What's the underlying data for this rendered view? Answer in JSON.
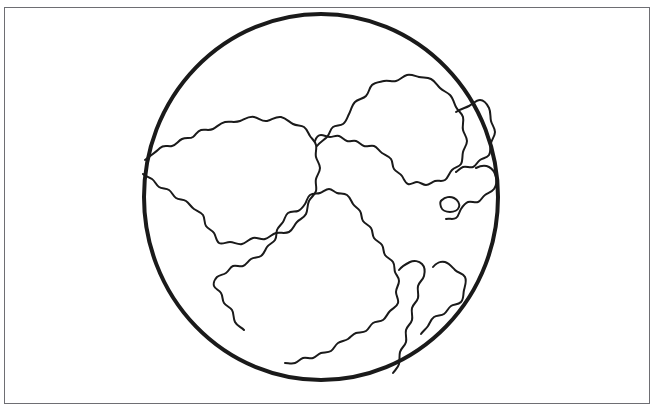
{
  "illustration": {
    "title": "Earth globe line drawing",
    "subject": "globe",
    "style": "black outline line art, uncolored (coloring-book style)",
    "caption": "",
    "background_color": "#ffffff",
    "frame": {
      "present": true,
      "color": "#6e6e73",
      "stroke_width_px": 1,
      "x": 4,
      "y": 7,
      "width": 646,
      "height": 397
    },
    "globe": {
      "shape": "circle",
      "outline_color": "#1a1a1a",
      "fill_color": "#ffffff",
      "stroke_width_px": 4,
      "center_x": 321,
      "center_y": 197,
      "radius_x": 179,
      "radius_y": 185,
      "bounds": {
        "left": 142,
        "top": 12,
        "right": 500,
        "bottom": 382
      }
    },
    "landmasses": {
      "outline_color": "#1a1a1a",
      "stroke_width_px": 2,
      "fill_color": "#ffffff",
      "count": 7,
      "items": [
        {
          "name": "northwest-landmass",
          "label": "upper-left continent"
        },
        {
          "name": "north-central-landmass",
          "label": "upper-central continent"
        },
        {
          "name": "northeast-landmass",
          "label": "upper-right continent"
        },
        {
          "name": "east-island",
          "label": "right-edge island"
        },
        {
          "name": "small-island",
          "label": "small oval island"
        },
        {
          "name": "south-central-landmass",
          "label": "lower-central continent"
        },
        {
          "name": "southeast-landmass",
          "label": "lower-right continent"
        },
        {
          "name": "southeast-outer-landmass",
          "label": "lower-right outer continent"
        }
      ]
    }
  }
}
